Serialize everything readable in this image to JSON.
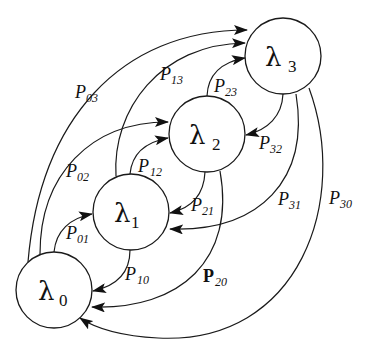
{
  "diagram": {
    "type": "state-transition",
    "nodes": [
      {
        "id": "0",
        "symbol": "λ",
        "sub": "0",
        "cx": 54,
        "cy": 290,
        "r": 38
      },
      {
        "id": "1",
        "symbol": "λ",
        "sub": "1",
        "cx": 131,
        "cy": 212,
        "r": 38
      },
      {
        "id": "2",
        "symbol": "λ",
        "sub": "2",
        "cx": 207,
        "cy": 134,
        "r": 38
      },
      {
        "id": "3",
        "symbol": "λ",
        "sub": "3",
        "cx": 283,
        "cy": 56,
        "r": 38
      }
    ],
    "edges": [
      {
        "from": "0",
        "to": "1",
        "p": "P",
        "sub": "01",
        "bold": false
      },
      {
        "from": "0",
        "to": "2",
        "p": "P",
        "sub": "02",
        "bold": false
      },
      {
        "from": "0",
        "to": "3",
        "p": "P",
        "sub": "03",
        "bold": false
      },
      {
        "from": "1",
        "to": "2",
        "p": "P",
        "sub": "12",
        "bold": false
      },
      {
        "from": "1",
        "to": "3",
        "p": "P",
        "sub": "13",
        "bold": false
      },
      {
        "from": "2",
        "to": "3",
        "p": "P",
        "sub": "23",
        "bold": false
      },
      {
        "from": "1",
        "to": "0",
        "p": "P",
        "sub": "10",
        "bold": false
      },
      {
        "from": "2",
        "to": "0",
        "p": "P",
        "sub": "20",
        "bold": true
      },
      {
        "from": "3",
        "to": "0",
        "p": "P",
        "sub": "30",
        "bold": false
      },
      {
        "from": "2",
        "to": "1",
        "p": "P",
        "sub": "21",
        "bold": false
      },
      {
        "from": "3",
        "to": "1",
        "p": "P",
        "sub": "31",
        "bold": false
      },
      {
        "from": "3",
        "to": "2",
        "p": "P",
        "sub": "32",
        "bold": false
      }
    ]
  },
  "labels": {
    "n0": {
      "sym": "λ",
      "sub": "0"
    },
    "n1": {
      "sym": "λ",
      "sub": "1"
    },
    "n2": {
      "sym": "λ",
      "sub": "2"
    },
    "n3": {
      "sym": "λ",
      "sub": "3"
    },
    "p01": {
      "p": "P",
      "sub": "01"
    },
    "p02": {
      "p": "P",
      "sub": "02"
    },
    "p03": {
      "p": "P",
      "sub": "03"
    },
    "p12": {
      "p": "P",
      "sub": "12"
    },
    "p13": {
      "p": "P",
      "sub": "13"
    },
    "p23": {
      "p": "P",
      "sub": "23"
    },
    "p10": {
      "p": "P",
      "sub": "10"
    },
    "p20": {
      "p": "P",
      "sub": "20"
    },
    "p30": {
      "p": "P",
      "sub": "30"
    },
    "p21": {
      "p": "P",
      "sub": "21"
    },
    "p31": {
      "p": "P",
      "sub": "31"
    },
    "p32": {
      "p": "P",
      "sub": "32"
    }
  },
  "colors": {
    "stroke": "#1a1a1a",
    "background": "#ffffff"
  }
}
